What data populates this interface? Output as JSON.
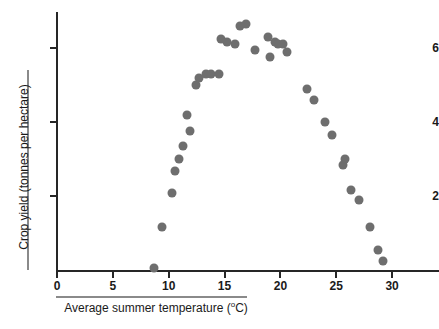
{
  "chart_data": {
    "type": "scatter",
    "title": "",
    "xlabel": "Average summer temperature (ºC)",
    "ylabel": "Crop yield (tonnes per hectare)",
    "xlim": [
      0,
      34
    ],
    "ylim": [
      0,
      7
    ],
    "xticks": [
      0,
      5,
      10,
      15,
      20,
      25,
      30
    ],
    "xtick_labels": [
      "0",
      "5",
      "10",
      "15",
      "20",
      "25",
      "30"
    ],
    "yticks": [
      2,
      4,
      6
    ],
    "ytick_labels": [
      "2",
      "4",
      "6"
    ],
    "grid": false,
    "legend": null,
    "marker_color": "#6e6e6e",
    "axis_color": "#262626",
    "series": [
      {
        "name": "Crop yield",
        "points": [
          [
            8.7,
            0.05
          ],
          [
            9.4,
            1.15
          ],
          [
            10.3,
            2.08
          ],
          [
            10.6,
            2.67
          ],
          [
            10.9,
            3.0
          ],
          [
            11.3,
            3.35
          ],
          [
            11.6,
            4.2
          ],
          [
            11.9,
            3.75
          ],
          [
            12.4,
            5.0
          ],
          [
            12.7,
            5.2
          ],
          [
            13.3,
            5.3
          ],
          [
            13.8,
            5.3
          ],
          [
            14.5,
            5.3
          ],
          [
            14.7,
            6.25
          ],
          [
            15.2,
            6.15
          ],
          [
            15.9,
            6.1
          ],
          [
            16.4,
            6.6
          ],
          [
            16.9,
            6.65
          ],
          [
            17.7,
            5.95
          ],
          [
            18.9,
            6.3
          ],
          [
            19.1,
            5.75
          ],
          [
            19.5,
            6.15
          ],
          [
            19.8,
            6.1
          ],
          [
            20.2,
            6.1
          ],
          [
            20.6,
            5.9
          ],
          [
            22.4,
            4.9
          ],
          [
            23.0,
            4.6
          ],
          [
            24.0,
            4.0
          ],
          [
            24.6,
            3.65
          ],
          [
            25.6,
            2.85
          ],
          [
            25.8,
            3.0
          ],
          [
            26.3,
            2.15
          ],
          [
            27.0,
            1.9
          ],
          [
            28.0,
            1.15
          ],
          [
            28.7,
            0.55
          ],
          [
            29.2,
            0.25
          ]
        ]
      }
    ]
  },
  "axis": {
    "x_title": "Average summer temperature (ºC)",
    "x_title_main": "Average summer temperature (",
    "x_title_unit": "o",
    "x_title_tail": "C)",
    "y_title": "Crop yield (tonnes per hectare)"
  }
}
